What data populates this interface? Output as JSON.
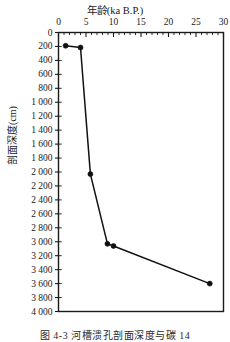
{
  "figure": {
    "caption": "图 4-3  河槽溃孔剖面深度与碳 14"
  },
  "chart_data": {
    "type": "line",
    "title": "",
    "xlabel": "年龄(ka B.P.)",
    "ylabel": "剖面深度(cm)",
    "xlim": [
      0,
      30
    ],
    "ylim": [
      0,
      4000
    ],
    "y_inverted": true,
    "x_axis_position": "top",
    "grid": false,
    "legend": "none",
    "x_tick_labels": [
      "0",
      "5",
      "10",
      "15",
      "20",
      "25",
      "30"
    ],
    "x_tick_values": [
      0,
      5,
      10,
      15,
      20,
      25,
      30
    ],
    "x_minor_tick_interval": 1,
    "y_tick_labels": [
      "0",
      "200",
      "400",
      "600",
      "800",
      "1 000",
      "1 200",
      "1 400",
      "1 600",
      "1 800",
      "2 000",
      "2 200",
      "2 400",
      "2 600",
      "2 800",
      "3 000",
      "3 200",
      "3 400",
      "3 600",
      "3 800",
      "4 000"
    ],
    "y_tick_values": [
      0,
      200,
      400,
      600,
      800,
      1000,
      1200,
      1400,
      1600,
      1800,
      2000,
      2200,
      2400,
      2600,
      2800,
      3000,
      3200,
      3400,
      3600,
      3800,
      4000
    ],
    "series": [
      {
        "name": "剖面深度与碳14年龄",
        "x": [
          1.3,
          4.0,
          5.8,
          8.9,
          10.0,
          27.5
        ],
        "y": [
          190,
          215,
          2030,
          3030,
          3060,
          3600
        ],
        "marker": "filled-circle",
        "marker_color": "#111111",
        "line_color": "#111111"
      }
    ]
  }
}
